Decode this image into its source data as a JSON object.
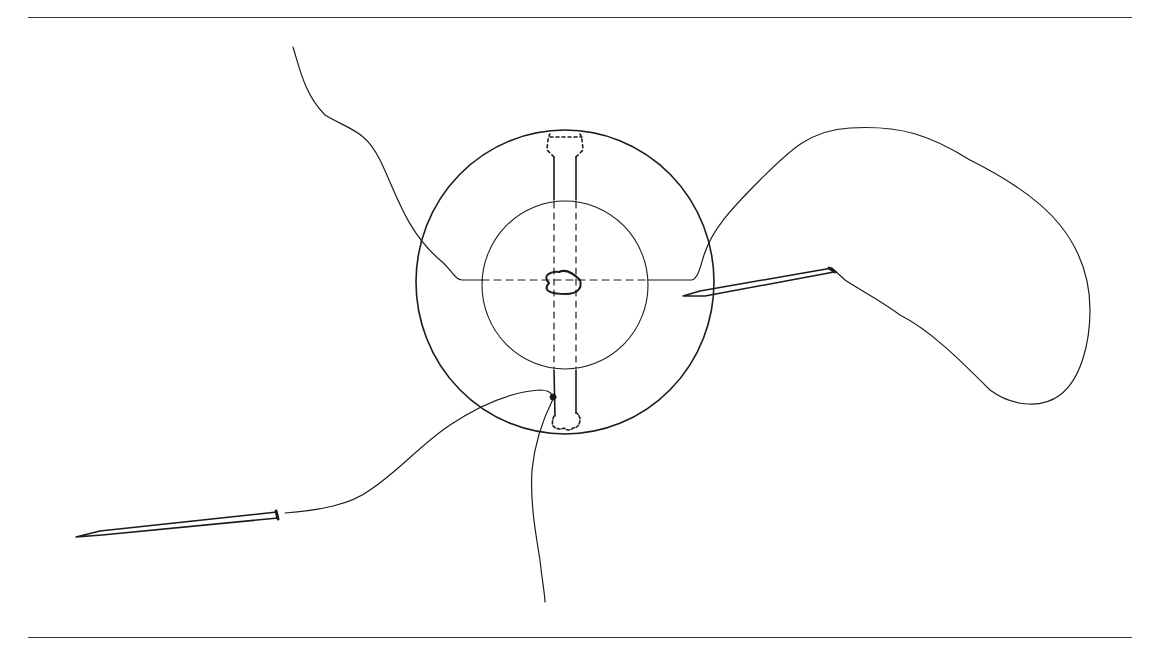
{
  "figure": {
    "colors": {
      "stroke": "#1a1a1a",
      "rule": "#333333",
      "background": "#ffffff"
    },
    "elements": [
      "outer-circle",
      "inner-circle",
      "center-hole",
      "vertical-channel",
      "horizontal-dashed-channel",
      "right-needle",
      "left-needle",
      "thread-top-left",
      "thread-right-loop",
      "thread-bottom-left",
      "thread-bottom"
    ]
  }
}
